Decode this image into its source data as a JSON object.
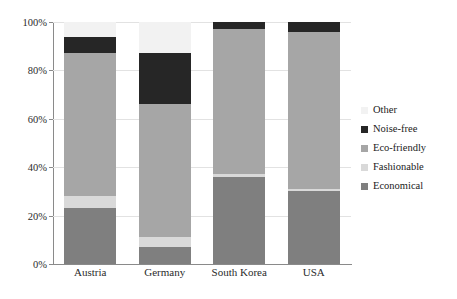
{
  "chart_data": {
    "type": "bar",
    "subtype": "stacked-bar-100-percent",
    "title": "",
    "xlabel": "",
    "ylabel": "",
    "ylim": [
      0,
      100
    ],
    "grid": true,
    "legend_position": "right",
    "categories": [
      "Austria",
      "Germany",
      "South Korea",
      "USA"
    ],
    "y_ticks": [
      0,
      20,
      40,
      60,
      80,
      100
    ],
    "y_tick_labels": [
      "0%",
      "20%",
      "40%",
      "60%",
      "80%",
      "100%"
    ],
    "series": [
      {
        "name": "Economical",
        "color": "#7f7f7f",
        "values": [
          23,
          7,
          36,
          30
        ]
      },
      {
        "name": "Fashionable",
        "color": "#d9d9d9",
        "values": [
          5,
          4,
          1,
          1
        ]
      },
      {
        "name": "Eco-friendly",
        "color": "#a6a6a6",
        "values": [
          59,
          55,
          60,
          65
        ]
      },
      {
        "name": "Noise-free",
        "color": "#262626",
        "values": [
          7,
          21,
          3,
          4
        ]
      },
      {
        "name": "Other",
        "color": "#f2f2f2",
        "values": [
          6,
          13,
          0,
          0
        ]
      }
    ],
    "stack_order_bottom_to_top": [
      "Economical",
      "Fashionable",
      "Eco-friendly",
      "Noise-free",
      "Other"
    ],
    "legend_order_top_to_bottom": [
      "Other",
      "Noise-free",
      "Eco-friendly",
      "Fashionable",
      "Economical"
    ],
    "colors": {
      "other": "#f2f2f2",
      "noise_free": "#262626",
      "eco_friendly": "#a6a6a6",
      "fashionable": "#d9d9d9",
      "economical": "#7f7f7f",
      "axis": "#8a8a8a",
      "grid": "#e2e2e2",
      "text": "#1a1a1a",
      "background": "#ffffff"
    }
  }
}
